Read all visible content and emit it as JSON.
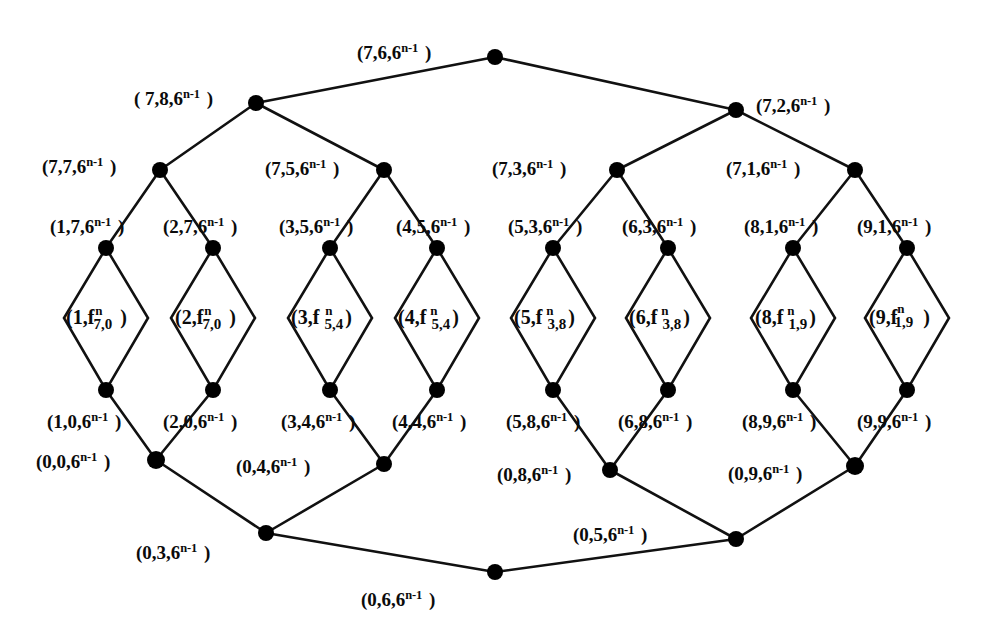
{
  "figure": {
    "type": "graph-diagram",
    "base": "6",
    "exponent": "n-1",
    "f_exponent": "n"
  },
  "edge_labels": {
    "top_center": {
      "text": "(7,6,6",
      "sup": "n-1",
      "close": ")"
    },
    "top_left": {
      "text": "( 7,8,6",
      "sup": "n-1",
      "close": ")"
    },
    "top_right": {
      "text": "(7,2,6",
      "sup": "n-1",
      "close": ")"
    },
    "r2_a": {
      "text": "(7,7,6",
      "sup": "n-1",
      "close": ")"
    },
    "r2_b": {
      "text": "(7,5,6",
      "sup": "n-1",
      "close": ")"
    },
    "r2_c": {
      "text": "(7,3,6",
      "sup": "n-1",
      "close": ")"
    },
    "r2_d": {
      "text": "(7,1,6",
      "sup": "n-1",
      "close": ")"
    },
    "r3_1": {
      "text": "(1,7,6",
      "sup": "n-1",
      "close": ")"
    },
    "r3_2": {
      "text": "(2,7,6",
      "sup": "n-1",
      "close": ")"
    },
    "r3_3": {
      "text": "(3,5,6",
      "sup": "n-1",
      "close": ")"
    },
    "r3_4": {
      "text": "(4,5,6",
      "sup": "n-1",
      "close": ")"
    },
    "r3_5": {
      "text": "(5,3,6",
      "sup": "n-1",
      "close": ")"
    },
    "r3_6": {
      "text": "(6,3,6",
      "sup": "n-1",
      "close": ")"
    },
    "r3_7": {
      "text": "(8,1,6",
      "sup": "n-1",
      "close": ")"
    },
    "r3_8": {
      "text": "(9,1,6",
      "sup": "n-1",
      "close": ")"
    },
    "r5_1": {
      "text": "(1,0,6",
      "sup": "n-1",
      "close": ")"
    },
    "r5_2": {
      "text": "(2,0,6",
      "sup": "n-1",
      "close": ")"
    },
    "r5_3": {
      "text": "(3,4,6",
      "sup": "n-1",
      "close": ")"
    },
    "r5_4": {
      "text": "(4,4,6",
      "sup": "n-1",
      "close": ")"
    },
    "r5_5": {
      "text": "(5,8,6",
      "sup": "n-1",
      "close": ")"
    },
    "r5_6": {
      "text": "(6,8,6",
      "sup": "n-1",
      "close": ")"
    },
    "r5_7": {
      "text": "(8,9,6",
      "sup": "n-1",
      "close": ")"
    },
    "r5_8": {
      "text": "(9,9,6",
      "sup": "n-1",
      "close": ")"
    },
    "r6_a": {
      "text": "(0,0,6",
      "sup": "n-1",
      "close": ")"
    },
    "r6_b": {
      "text": "(0,4,6",
      "sup": "n-1",
      "close": ")"
    },
    "r6_c": {
      "text": "(0,8,6",
      "sup": "n-1",
      "close": ")"
    },
    "r6_d": {
      "text": "(0,9,6",
      "sup": "n-1",
      "close": ")"
    },
    "bottom_left": {
      "text": "(0,3,6",
      "sup": "n-1",
      "close": ")"
    },
    "bottom_center": {
      "text": "(0,6,6",
      "sup": "n-1",
      "close": ")"
    },
    "bottom_right": {
      "text": "(0,5,6",
      "sup": "n-1",
      "close": ")"
    }
  },
  "cells": [
    {
      "id": "cell-1",
      "prefix": "(1,f",
      "sup": "n",
      "sub": "7,0",
      "close": ")"
    },
    {
      "id": "cell-2",
      "prefix": "(2,f",
      "sup": "n",
      "sub": "7,0",
      "close": ")"
    },
    {
      "id": "cell-3",
      "prefix": "(3,f",
      "sup": "n",
      "sub": "5,4",
      "close": ")"
    },
    {
      "id": "cell-4",
      "prefix": "(4,f",
      "sup": "n",
      "sub": "5,4",
      "close": ")"
    },
    {
      "id": "cell-5",
      "prefix": "(5,f",
      "sup": "n",
      "sub": "3,8",
      "close": ")"
    },
    {
      "id": "cell-6",
      "prefix": "(6,f",
      "sup": "n",
      "sub": "3,8",
      "close": ")"
    },
    {
      "id": "cell-7",
      "prefix": "(8,f",
      "sup": "n",
      "sub": "1,9",
      "close": ")"
    },
    {
      "id": "cell-8",
      "prefix": "(9,f",
      "sup": "n",
      "sub": "1,9",
      "close": ")"
    }
  ],
  "style": {
    "line_color": "#111111",
    "node_color": "#000000",
    "background": "#ffffff"
  }
}
